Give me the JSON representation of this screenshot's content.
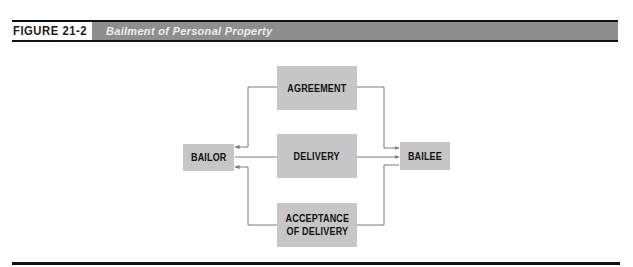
{
  "figure": {
    "label": "FIGURE 21-2",
    "title": "Bailment of Personal Property"
  },
  "diagram": {
    "nodes": {
      "bailor": "BAILOR",
      "agreement": "AGREEMENT",
      "delivery": "DELIVERY",
      "acceptance_line1": "ACCEPTANCE",
      "acceptance_line2": "OF DELIVERY",
      "bailee": "BAILEE"
    },
    "edges": [
      {
        "from": "agreement",
        "to": "bailor"
      },
      {
        "from": "agreement",
        "to": "bailee"
      },
      {
        "from": "delivery",
        "to": "bailor"
      },
      {
        "from": "delivery",
        "to": "bailee"
      },
      {
        "from": "acceptance",
        "to": "bailor"
      },
      {
        "from": "acceptance",
        "to": "bailee"
      }
    ]
  },
  "colors": {
    "title_bar": "#8e8e8e",
    "box_fill": "#c6c6c6",
    "connector": "#7a7a7a",
    "rule": "#111111"
  }
}
